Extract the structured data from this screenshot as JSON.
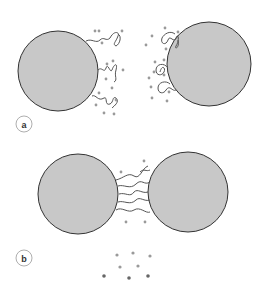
{
  "panels": [
    {
      "label": "a",
      "description": "Two particles with extended polymer chains and surrounding solvent/ion dots, separated"
    },
    {
      "label": "b",
      "description": "Two particles approached, polymer chains interpenetrating in the gap; displaced dots below"
    }
  ],
  "colors": {
    "particle_fill": "#c8c8c8",
    "particle_stroke": "#333333",
    "chain_stroke": "#555555",
    "dot_light": "#9a9a9a",
    "dot_dark": "#666666",
    "label_circle": "#999999"
  }
}
